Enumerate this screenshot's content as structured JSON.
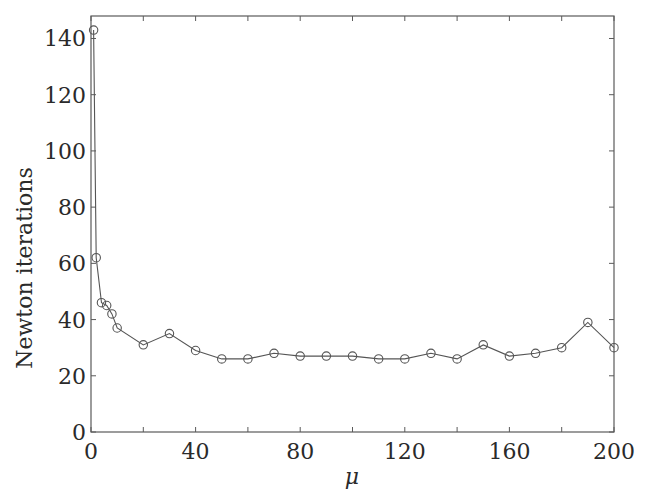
{
  "chart_data": {
    "type": "line",
    "title": "",
    "xlabel": "μ",
    "ylabel": "Newton iterations",
    "xlim": [
      0,
      200
    ],
    "ylim": [
      0,
      148
    ],
    "xticks": [
      0,
      40,
      80,
      120,
      160,
      200
    ],
    "xticks_minor": [
      20,
      60,
      100,
      140,
      180
    ],
    "yticks": [
      0,
      20,
      40,
      60,
      80,
      100,
      120,
      140
    ],
    "grid": false,
    "legend": null,
    "marker": "open-circle",
    "line_color": "#555555",
    "series": [
      {
        "name": "Newton iterations",
        "x": [
          1,
          2,
          4,
          6,
          8,
          10,
          20,
          30,
          40,
          50,
          60,
          70,
          80,
          90,
          100,
          110,
          120,
          130,
          140,
          150,
          160,
          170,
          180,
          190,
          200
        ],
        "y": [
          143,
          62,
          46,
          45,
          42,
          37,
          31,
          35,
          29,
          26,
          26,
          28,
          27,
          27,
          27,
          26,
          26,
          28,
          26,
          31,
          27,
          28,
          30,
          39,
          30
        ]
      }
    ]
  }
}
